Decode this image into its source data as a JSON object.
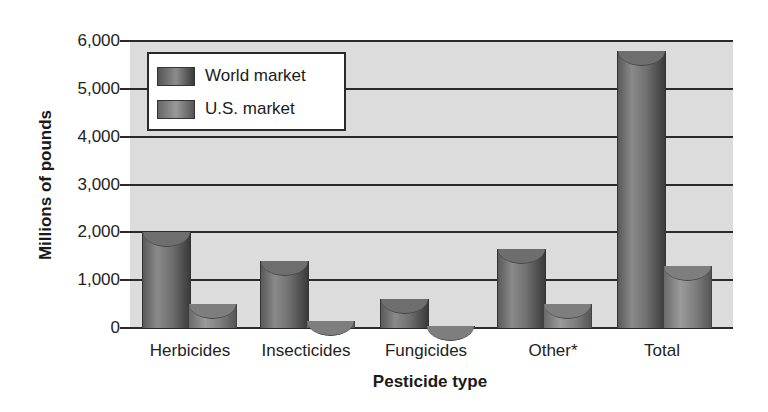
{
  "chart_data": {
    "type": "bar",
    "title": "",
    "xlabel": "Pesticide type",
    "ylabel": "Millions of pounds",
    "ylim": [
      0,
      6000
    ],
    "yticks": [
      "0",
      "1,000",
      "2,000",
      "3,000",
      "4,000",
      "5,000",
      "6,000"
    ],
    "grid": true,
    "legend_position": "upper-left",
    "categories": [
      "Herbicides",
      "Insecticides",
      "Fungicides",
      "Other*",
      "Total"
    ],
    "series": [
      {
        "name": "World market",
        "values": [
          2000,
          1400,
          600,
          1650,
          5800
        ]
      },
      {
        "name": "U.S. market",
        "values": [
          500,
          150,
          50,
          500,
          1300
        ]
      }
    ]
  },
  "legend": {
    "world": "World market",
    "us": "U.S. market"
  }
}
